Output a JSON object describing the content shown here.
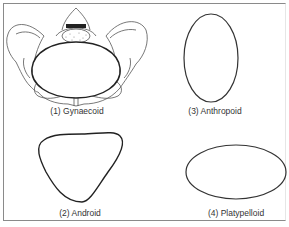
{
  "figure": {
    "types": [
      {
        "number": "(1)",
        "name": "Gynaecoid",
        "label": "(1) Gynaecoid"
      },
      {
        "number": "(2)",
        "name": "Android",
        "label": "(2) Android"
      },
      {
        "number": "(3)",
        "name": "Anthropoid",
        "label": "(3) Anthropoid"
      },
      {
        "number": "(4)",
        "name": "Platypelloid",
        "label": "(4) Platypelloid"
      }
    ],
    "colors": {
      "stroke": "#222222",
      "border": "#8a8a8a",
      "bone": "#555555"
    }
  }
}
